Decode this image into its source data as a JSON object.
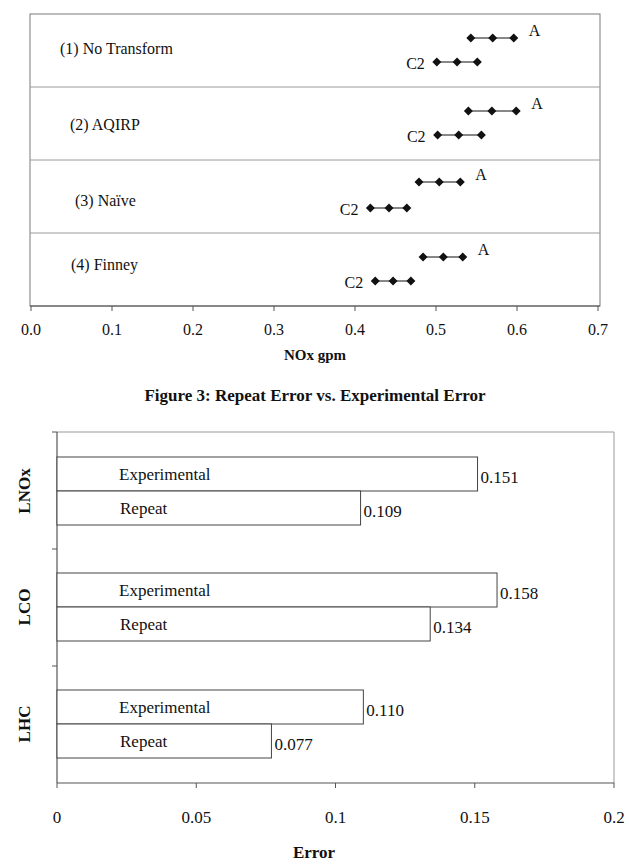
{
  "chart_data": [
    {
      "type": "scatter",
      "subtype": "interval-dot-plot",
      "title": "",
      "xlabel": "NOx gpm",
      "ylabel": "",
      "xlim": [
        0.0,
        0.7
      ],
      "x_ticks": [
        "0.0",
        "0.1",
        "0.2",
        "0.3",
        "0.4",
        "0.5",
        "0.6",
        "0.7"
      ],
      "grid": false,
      "legend": null,
      "rows": [
        {
          "label": "(1) No Transform",
          "series": [
            {
              "name": "A",
              "values": [
                0.543,
                0.57,
                0.596
              ]
            },
            {
              "name": "C2",
              "values": [
                0.501,
                0.526,
                0.551
              ]
            }
          ]
        },
        {
          "label": "(2) AQIRP",
          "series": [
            {
              "name": "A",
              "values": [
                0.54,
                0.569,
                0.599
              ]
            },
            {
              "name": "C2",
              "values": [
                0.502,
                0.528,
                0.556
              ]
            }
          ]
        },
        {
          "label": "(3)  Naïve",
          "series": [
            {
              "name": "A",
              "values": [
                0.479,
                0.504,
                0.53
              ]
            },
            {
              "name": "C2",
              "values": [
                0.419,
                0.442,
                0.464
              ]
            }
          ]
        },
        {
          "label": "(4) Finney",
          "series": [
            {
              "name": "A",
              "values": [
                0.484,
                0.509,
                0.533
              ]
            },
            {
              "name": "C2",
              "values": [
                0.425,
                0.447,
                0.469
              ]
            }
          ]
        }
      ]
    },
    {
      "type": "bar",
      "orientation": "horizontal",
      "title": "Figure 3: Repeat Error vs. Experimental Error",
      "xlabel": "Error",
      "ylabel": "",
      "xlim": [
        0,
        0.2
      ],
      "x_ticks": [
        "0",
        "0.05",
        "0.1",
        "0.15",
        "0.2"
      ],
      "grid": false,
      "legend": null,
      "categories": [
        "LNOx",
        "LCO",
        "LHC"
      ],
      "series": [
        {
          "name": "Experimental",
          "values": [
            0.151,
            0.158,
            0.11
          ],
          "labels": [
            "0.151",
            "0.158",
            "0.110"
          ]
        },
        {
          "name": "Repeat",
          "values": [
            0.109,
            0.134,
            0.077
          ],
          "labels": [
            "0.109",
            "0.134",
            "0.077"
          ]
        }
      ]
    }
  ],
  "chart1": {
    "rows": [
      {
        "label": "(1) No Transform",
        "a_label": "A",
        "c2_label": "C2"
      },
      {
        "label": "(2) AQIRP",
        "a_label": "A",
        "c2_label": "C2"
      },
      {
        "label": "(3)  Naïve",
        "a_label": "A",
        "c2_label": "C2"
      },
      {
        "label": "(4) Finney",
        "a_label": "A",
        "c2_label": "C2"
      }
    ],
    "ticks": [
      "0.0",
      "0.1",
      "0.2",
      "0.3",
      "0.4",
      "0.5",
      "0.6",
      "0.7"
    ],
    "xlabel": "NOx gpm"
  },
  "chart2": {
    "title": "Figure 3: Repeat Error vs. Experimental Error",
    "groups": [
      {
        "category": "LNOx",
        "exp_label": "Experimental",
        "exp_value": "0.151",
        "rep_label": "Repeat",
        "rep_value": "0.109"
      },
      {
        "category": "LCO",
        "exp_label": "Experimental",
        "exp_value": "0.158",
        "rep_label": "Repeat",
        "rep_value": "0.134"
      },
      {
        "category": "LHC",
        "exp_label": "Experimental",
        "exp_value": "0.110",
        "rep_label": "Repeat",
        "rep_value": "0.077"
      }
    ],
    "ticks": [
      "0",
      "0.05",
      "0.1",
      "0.15",
      "0.2"
    ],
    "xlabel": "Error"
  },
  "colors": {
    "ink": "#111111",
    "frame": "#7a7a7a",
    "divider": "#9a9a9a",
    "bar_fill": "#ffffff",
    "bar_stroke": "#444444"
  }
}
